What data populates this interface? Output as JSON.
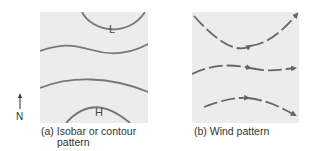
{
  "north": {
    "label": "N"
  },
  "panel_a": {
    "caption_line1": "(a) Isobar or contour",
    "caption_line2": "pattern",
    "low_label": "L",
    "high_label": "H"
  },
  "panel_b": {
    "caption": "(b) Wind pattern"
  },
  "colors": {
    "panel_bg": "#ececec",
    "line": "#777777",
    "arrow": "#666666",
    "text": "#333333"
  }
}
